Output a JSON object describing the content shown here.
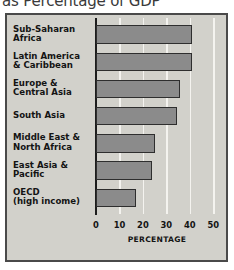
{
  "title": "as Percentage of GDP",
  "colors": {
    "background": "#d2d1cb",
    "bar_fill": "#8b8b8b",
    "bar_outline": "#2e2e2e",
    "gridline": "#f4f3ef",
    "axis": "#1d1d1d",
    "text": "#141414",
    "frame": "#4a4a4a"
  },
  "chart_data": {
    "type": "bar",
    "orientation": "horizontal",
    "title": "as Percentage of GDP",
    "xlabel": "PERCENTAGE",
    "ylabel": "",
    "xlim": [
      0,
      52
    ],
    "xticks": [
      0,
      10,
      20,
      30,
      40,
      50
    ],
    "xtick_labels": [
      "0",
      "10",
      "20",
      "30",
      "40",
      "50"
    ],
    "grid": true,
    "grid_axis": "x",
    "legend": false,
    "categories": [
      "Sub-Saharan Africa",
      "Latin America & Caribbean",
      "Europe & Central Asia",
      "South Asia",
      "Middle East & North Africa",
      "East Asia & Pacific",
      "OECD (high income)"
    ],
    "category_lines": [
      [
        "Sub-Saharan",
        "Africa"
      ],
      [
        "Latin America",
        "& Caribbean"
      ],
      [
        "Europe &",
        "Central Asia"
      ],
      [
        "South Asia"
      ],
      [
        "Middle East &",
        "North Africa"
      ],
      [
        "East Asia &",
        "Pacific"
      ],
      [
        "OECD",
        "(high income)"
      ]
    ],
    "values": [
      41,
      41,
      36,
      34.5,
      25,
      24,
      17
    ]
  }
}
